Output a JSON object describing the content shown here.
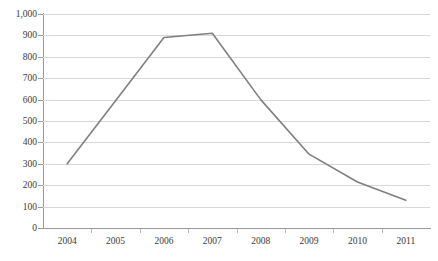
{
  "chart_data": {
    "type": "line",
    "title": "",
    "subtitle": "",
    "xlabel": "",
    "ylabel": "",
    "categories": [
      "2004",
      "2005",
      "2006",
      "2007",
      "2008",
      "2009",
      "2010",
      "2011"
    ],
    "values": [
      300,
      595,
      890,
      910,
      600,
      345,
      215,
      130
    ],
    "series": [
      {
        "name": "",
        "values": [
          300,
          595,
          890,
          910,
          600,
          345,
          215,
          130
        ]
      }
    ],
    "ylim": [
      0,
      1000
    ],
    "y_ticks": [
      0,
      100,
      200,
      300,
      400,
      500,
      600,
      700,
      800,
      900,
      1000
    ],
    "y_tick_labels": [
      "0",
      "100",
      "200",
      "300",
      "400",
      "500",
      "600",
      "700",
      "800",
      "900",
      "1,000"
    ],
    "x_tick_labels": [
      "2004",
      "2005",
      "2006",
      "2007",
      "2008",
      "2009",
      "2010",
      "2011"
    ],
    "grid": true,
    "grid_axis": "y",
    "legend": false,
    "legend_position": "none",
    "annotations": [],
    "colors": {
      "line": "#7f7f7f",
      "gridline": "#d9d9d9",
      "axis": "#9a9a9a",
      "tick_label": "#3a3a3a",
      "background": "#ffffff"
    }
  }
}
